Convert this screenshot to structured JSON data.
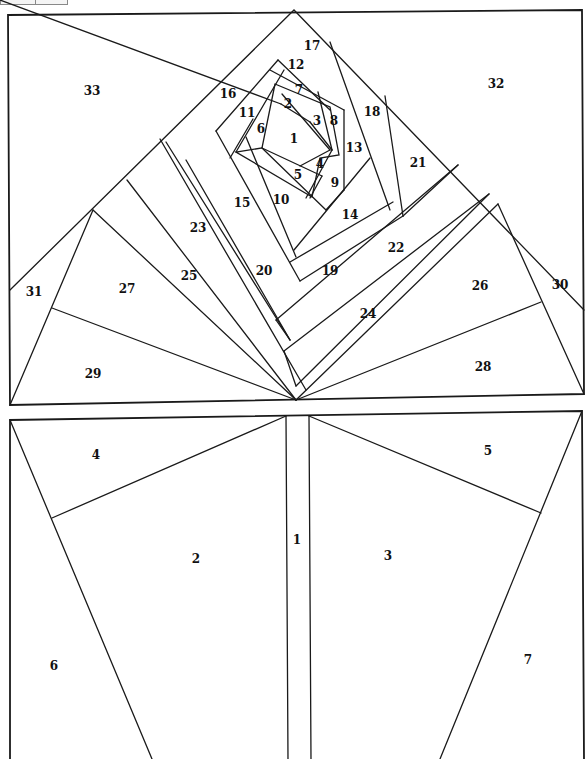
{
  "top_block": {
    "name": "rose-block",
    "labels": [
      {
        "n": "1",
        "x": 294,
        "y": 139
      },
      {
        "n": "2",
        "x": 288,
        "y": 104
      },
      {
        "n": "3",
        "x": 317,
        "y": 121
      },
      {
        "n": "4",
        "x": 320,
        "y": 164
      },
      {
        "n": "5",
        "x": 298,
        "y": 175
      },
      {
        "n": "6",
        "x": 261,
        "y": 129
      },
      {
        "n": "7",
        "x": 299,
        "y": 90
      },
      {
        "n": "8",
        "x": 334,
        "y": 121
      },
      {
        "n": "9",
        "x": 335,
        "y": 183
      },
      {
        "n": "10",
        "x": 281,
        "y": 200
      },
      {
        "n": "11",
        "x": 247,
        "y": 113
      },
      {
        "n": "12",
        "x": 296,
        "y": 65
      },
      {
        "n": "13",
        "x": 354,
        "y": 148
      },
      {
        "n": "14",
        "x": 350,
        "y": 215
      },
      {
        "n": "15",
        "x": 242,
        "y": 203
      },
      {
        "n": "16",
        "x": 228,
        "y": 94
      },
      {
        "n": "17",
        "x": 312,
        "y": 46
      },
      {
        "n": "18",
        "x": 372,
        "y": 112
      },
      {
        "n": "19",
        "x": 330,
        "y": 271
      },
      {
        "n": "20",
        "x": 264,
        "y": 271
      },
      {
        "n": "21",
        "x": 418,
        "y": 163
      },
      {
        "n": "22",
        "x": 396,
        "y": 248
      },
      {
        "n": "23",
        "x": 198,
        "y": 228
      },
      {
        "n": "24",
        "x": 368,
        "y": 314
      },
      {
        "n": "25",
        "x": 189,
        "y": 276
      },
      {
        "n": "26",
        "x": 480,
        "y": 286
      },
      {
        "n": "27",
        "x": 127,
        "y": 289
      },
      {
        "n": "28",
        "x": 483,
        "y": 367
      },
      {
        "n": "29",
        "x": 93,
        "y": 374
      },
      {
        "n": "30",
        "x": 560,
        "y": 285
      },
      {
        "n": "31",
        "x": 34,
        "y": 292
      },
      {
        "n": "32",
        "x": 496,
        "y": 84
      },
      {
        "n": "33",
        "x": 92,
        "y": 91
      }
    ]
  },
  "bottom_block": {
    "name": "stem-block",
    "labels": [
      {
        "n": "1",
        "x": 297,
        "y": 540
      },
      {
        "n": "2",
        "x": 196,
        "y": 559
      },
      {
        "n": "3",
        "x": 388,
        "y": 556
      },
      {
        "n": "4",
        "x": 96,
        "y": 455
      },
      {
        "n": "5",
        "x": 488,
        "y": 451
      },
      {
        "n": "6",
        "x": 54,
        "y": 666
      },
      {
        "n": "7",
        "x": 528,
        "y": 660
      }
    ]
  },
  "colors": {
    "line": "#1a1a1a",
    "background": "#ffffff",
    "label": "#111111"
  }
}
